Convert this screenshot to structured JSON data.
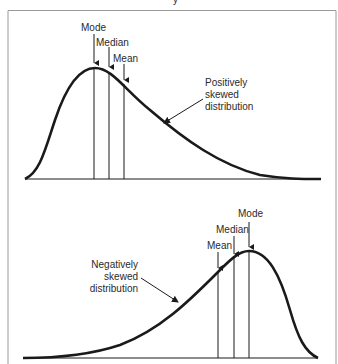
{
  "figure": {
    "title_fragment": "y",
    "border_color": "#9a9a9a",
    "stroke_color": "#1a1a1a"
  },
  "positive_panel": {
    "name": "Positively skewed distribution",
    "caption_lines": [
      "Positively",
      "skewed",
      "distribution"
    ],
    "markers": [
      {
        "label": "Mode",
        "x": 94
      },
      {
        "label": "Median",
        "x": 109
      },
      {
        "label": "Mean",
        "x": 124
      }
    ]
  },
  "negative_panel": {
    "name": "Negatively skewed distribution",
    "caption_lines": [
      "Negatively",
      "skewed",
      "distribution"
    ],
    "markers": [
      {
        "label": "Mean",
        "x": 218
      },
      {
        "label": "Median",
        "x": 234
      },
      {
        "label": "Mode",
        "x": 249
      }
    ]
  }
}
